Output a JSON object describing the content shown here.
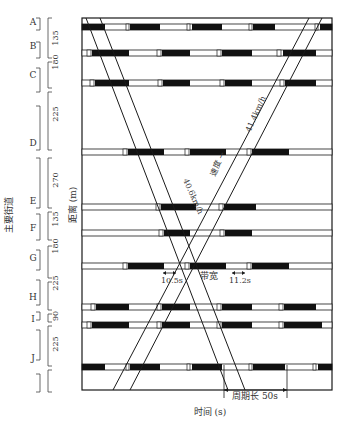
{
  "figure": {
    "ylabel_left": "主要街道",
    "ylabel_axis": "距离 (m)",
    "xlabel": "时间 (s)",
    "cycle_label": "周期长 50s",
    "bandwidth_label": "带宽",
    "bandwidth_left": "10.5s",
    "bandwidth_right": "11.2s",
    "speed_down": "40.6km/h",
    "speed_up": "41.4km/h",
    "speed_word": "速度 →"
  },
  "intersections": [
    {
      "name": "A",
      "y": 27
    },
    {
      "name": "B",
      "y": 83
    },
    {
      "name": "C",
      "y": 83
    },
    {
      "name": "D",
      "y": 152
    },
    {
      "name": "E",
      "y": 207
    },
    {
      "name": "F",
      "y": 233
    },
    {
      "name": "G",
      "y": 266
    },
    {
      "name": "H",
      "y": 307
    },
    {
      "name": "I",
      "y": 325
    },
    {
      "name": "J",
      "y": 368
    }
  ],
  "left_labels": [
    {
      "name": "A",
      "y": 22
    },
    {
      "name": "B",
      "y": 46
    },
    {
      "name": "C",
      "y": 75
    },
    {
      "name": "D",
      "y": 143
    },
    {
      "name": "E",
      "y": 201
    },
    {
      "name": "F",
      "y": 228
    },
    {
      "name": "G",
      "y": 258
    },
    {
      "name": "H",
      "y": 297
    },
    {
      "name": "I",
      "y": 319
    },
    {
      "name": "J",
      "y": 358
    }
  ],
  "distances": [
    {
      "value": "135",
      "y": 38
    },
    {
      "value": "180",
      "y": 62
    },
    {
      "value": "225",
      "y": 114
    },
    {
      "value": "270",
      "y": 180
    },
    {
      "value": "135",
      "y": 219
    },
    {
      "value": "180",
      "y": 246
    },
    {
      "value": "225",
      "y": 283
    },
    {
      "value": "90",
      "y": 316
    },
    {
      "value": "225",
      "y": 344
    }
  ],
  "signal_rows": [
    {
      "y": 27,
      "reds": [
        [
          82,
          105
        ],
        [
          130,
          160
        ],
        [
          192,
          222
        ],
        [
          253,
          275
        ]
      ],
      "ambers": [
        [
          126,
          129
        ],
        [
          187,
          190
        ],
        [
          249,
          252
        ],
        [
          315,
          318
        ]
      ],
      "redEnd": [
        320,
        332
      ]
    },
    {
      "y": 53,
      "reds": [
        [
          92,
          129
        ],
        [
          162,
          190
        ],
        [
          222,
          252
        ]
      ],
      "ambers": [
        [
          87,
          91
        ],
        [
          157,
          161
        ],
        [
          217,
          221
        ],
        [
          277,
          281
        ]
      ],
      "redEnd": [
        283,
        316
      ]
    },
    {
      "y": 83,
      "reds": [
        [
          95,
          129
        ],
        [
          163,
          190
        ],
        [
          225,
          252
        ]
      ],
      "ambers": [
        [
          90,
          94
        ],
        [
          158,
          162
        ],
        [
          220,
          224
        ],
        [
          280,
          284
        ]
      ],
      "redEnd": [
        285,
        316
      ]
    },
    {
      "y": 152,
      "reds": [
        [
          128,
          164
        ],
        [
          190,
          226
        ],
        [
          252,
          289
        ]
      ],
      "ambers": [
        [
          123,
          127
        ],
        [
          185,
          189
        ],
        [
          247,
          251
        ]
      ],
      "redEnd": null
    },
    {
      "y": 207,
      "reds": [
        [
          161,
          196
        ],
        [
          224,
          256
        ]
      ],
      "ambers": [
        [
          156,
          160
        ],
        [
          219,
          223
        ]
      ],
      "redEnd": null
    },
    {
      "y": 233,
      "reds": [
        [
          164,
          190
        ],
        [
          225,
          252
        ]
      ],
      "ambers": [
        [
          159,
          163
        ],
        [
          220,
          224
        ]
      ],
      "redEnd": null
    },
    {
      "y": 266,
      "reds": [
        [
          128,
          164
        ],
        [
          190,
          226
        ],
        [
          252,
          289
        ]
      ],
      "ambers": [
        [
          123,
          127
        ],
        [
          185,
          189
        ],
        [
          247,
          251
        ]
      ],
      "redEnd": null
    },
    {
      "y": 307,
      "reds": [
        [
          96,
          129
        ],
        [
          162,
          190
        ],
        [
          222,
          252
        ],
        [
          284,
          316
        ]
      ],
      "ambers": [
        [
          91,
          95
        ],
        [
          157,
          161
        ],
        [
          217,
          221
        ],
        [
          279,
          283
        ]
      ],
      "redEnd": null
    },
    {
      "y": 325,
      "reds": [
        [
          92,
          129
        ],
        [
          162,
          190
        ],
        [
          222,
          252
        ],
        [
          284,
          322
        ]
      ],
      "ambers": [
        [
          87,
          91
        ],
        [
          157,
          161
        ],
        [
          217,
          221
        ],
        [
          279,
          283
        ]
      ],
      "redEnd": null
    },
    {
      "y": 367,
      "reds": [
        [
          82,
          105
        ],
        [
          130,
          160
        ],
        [
          192,
          222
        ],
        [
          253,
          285
        ]
      ],
      "ambers": [
        [
          126,
          129
        ],
        [
          187,
          190
        ],
        [
          249,
          252
        ],
        [
          313,
          316
        ]
      ],
      "redEnd": [
        318,
        332
      ]
    }
  ],
  "bands": {
    "down": [
      [
        86,
        18,
        228,
        390
      ],
      [
        100,
        18,
        245,
        390
      ]
    ],
    "up": [
      [
        113,
        390,
        309,
        18
      ],
      [
        130,
        390,
        322,
        18
      ]
    ]
  },
  "colors": {
    "ink": "#1a1a1a",
    "paper": "#ffffff",
    "red_phase": "#111111"
  }
}
